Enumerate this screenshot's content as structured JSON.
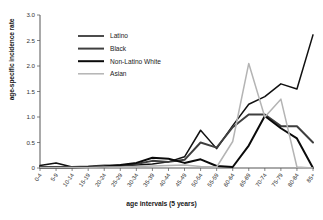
{
  "chart_data": {
    "type": "line",
    "title": "",
    "xlabel": "age intervals (5 years)",
    "ylabel": "age-specific incidence rate",
    "ylim": [
      0,
      3.0
    ],
    "yticks": [
      "0",
      "0.5",
      "1.0",
      "1.5",
      "2.0",
      "2.5",
      "3.0"
    ],
    "ytick_values": [
      0,
      0.5,
      1.0,
      1.5,
      2.0,
      2.5,
      3.0
    ],
    "grid": false,
    "legend_position": "upper-left",
    "categories": [
      "0-4",
      "5-9",
      "10-14",
      "15-19",
      "20-24",
      "25-29",
      "30-34",
      "35-39",
      "40-44",
      "45-49",
      "50-54",
      "55-59",
      "60-64",
      "65-69",
      "70-74",
      "75-79",
      "80-84",
      "85+"
    ],
    "series": [
      {
        "name": "Latino",
        "color": "#111111",
        "width": 1.5,
        "values": [
          0.05,
          0.1,
          0.02,
          0.02,
          0.04,
          0.04,
          0.06,
          0.08,
          0.12,
          0.22,
          0.74,
          0.38,
          0.83,
          1.25,
          1.4,
          1.65,
          1.55,
          2.61
        ]
      },
      {
        "name": "Black",
        "color": "#3f3f3f",
        "width": 2.0,
        "values": [
          0.02,
          0.02,
          0.02,
          0.03,
          0.05,
          0.05,
          0.08,
          0.14,
          0.12,
          0.16,
          0.5,
          0.4,
          0.8,
          1.05,
          1.05,
          0.82,
          0.82,
          0.5
        ]
      },
      {
        "name": "Non-Latino White",
        "color": "#0a0a0a",
        "width": 2.0,
        "values": [
          0.01,
          0.01,
          0.01,
          0.02,
          0.03,
          0.06,
          0.1,
          0.2,
          0.18,
          0.1,
          0.17,
          0.04,
          0.02,
          0.44,
          1.02,
          0.78,
          0.58,
          0.0
        ]
      },
      {
        "name": "Asian",
        "color": "#b4b4b4",
        "width": 1.5,
        "values": [
          0.01,
          0.01,
          0.01,
          0.01,
          0.02,
          0.02,
          0.03,
          0.04,
          0.05,
          0.06,
          0.03,
          0.02,
          0.52,
          2.05,
          1.0,
          1.35,
          0.02,
          0.0
        ]
      }
    ]
  },
  "legend": {
    "items": [
      {
        "label": "Latino"
      },
      {
        "label": "Black"
      },
      {
        "label": "Non-Latino White"
      },
      {
        "label": "Asian"
      }
    ]
  }
}
